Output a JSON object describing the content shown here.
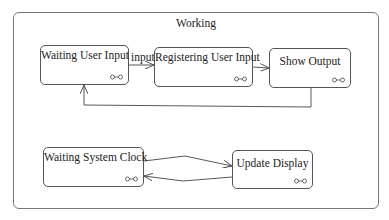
{
  "composite": {
    "title": "Working"
  },
  "states": [
    {
      "id": "waiting-user-input",
      "label": "Waiting User Input",
      "icon": "composite-state-icon"
    },
    {
      "id": "registering-user-input",
      "label": "Registering User Input",
      "icon": "composite-state-icon"
    },
    {
      "id": "show-output",
      "label": "Show Output",
      "icon": "composite-state-icon"
    },
    {
      "id": "waiting-system-clock",
      "label": "Waiting System Clock",
      "icon": "composite-state-icon"
    },
    {
      "id": "update-display",
      "label": "Update Display",
      "icon": "composite-state-icon"
    }
  ],
  "transitions": [
    {
      "from": "waiting-user-input",
      "to": "registering-user-input",
      "label": "input"
    },
    {
      "from": "registering-user-input",
      "to": "show-output",
      "label": ""
    },
    {
      "from": "show-output",
      "to": "waiting-user-input",
      "label": ""
    },
    {
      "from": "waiting-system-clock",
      "to": "update-display",
      "label": ""
    },
    {
      "from": "update-display",
      "to": "waiting-system-clock",
      "label": ""
    }
  ],
  "colors": {
    "stroke": "#555555",
    "outer_stroke": "#777777",
    "background": "#ffffff"
  }
}
